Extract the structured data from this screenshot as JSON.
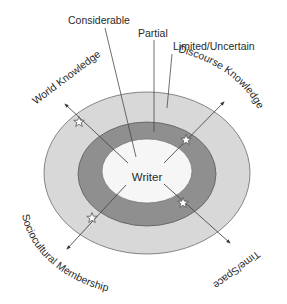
{
  "diagram": {
    "type": "concentric-ellipse-diagram",
    "center_label": "Writer",
    "rings": [
      {
        "name": "Considerable",
        "color": "#f6f6f6"
      },
      {
        "name": "Partial",
        "color": "#8f8f8f"
      },
      {
        "name": "Limited/Uncertain",
        "color": "#d8d8d8"
      }
    ],
    "ring_labels": {
      "considerable": "Considerable",
      "partial": "Partial",
      "limited": "Limited/Uncertain"
    },
    "axes": [
      {
        "label": "World Knowledge",
        "direction": "upper-left"
      },
      {
        "label": "Discourse Knowledge",
        "direction": "upper-right"
      },
      {
        "label": "Time/Space",
        "direction": "lower-right"
      },
      {
        "label": "Sociocultural Membership",
        "direction": "lower-left"
      }
    ],
    "markers": {
      "symbol": "star",
      "count": 4
    },
    "colors": {
      "outer_ring": "#d8d8d8",
      "middle_ring": "#8f8f8f",
      "inner_core": "#f6f6f6",
      "stroke": "#555555",
      "text": "#2a2a2a"
    }
  }
}
